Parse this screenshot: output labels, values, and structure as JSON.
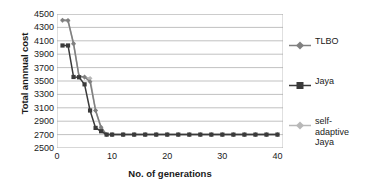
{
  "chart_data": {
    "type": "line",
    "title": "",
    "xlabel": "No. of generations",
    "ylabel": "Total annnual cost",
    "xlim": [
      0,
      41
    ],
    "ylim": [
      2500,
      4500
    ],
    "ytick_step": 200,
    "grid": "horizontal",
    "legend_position": "right",
    "xticks": [
      0,
      10,
      20,
      30,
      40
    ],
    "yticks": [
      2500,
      2700,
      2900,
      3100,
      3300,
      3500,
      3700,
      3900,
      4100,
      4300,
      4500
    ],
    "series": [
      {
        "name": "TLBO",
        "color": "#808080",
        "marker": "diamond",
        "x": [
          1,
          2,
          3,
          4,
          5,
          6,
          7,
          8,
          9,
          10,
          12,
          14,
          16,
          18,
          20,
          22,
          24,
          26,
          28,
          30,
          32,
          34,
          36,
          38,
          40
        ],
        "values": [
          4410,
          4405,
          4060,
          3570,
          3560,
          3490,
          3060,
          2810,
          2700,
          2700,
          2700,
          2700,
          2700,
          2700,
          2700,
          2700,
          2700,
          2700,
          2700,
          2700,
          2700,
          2700,
          2700,
          2700,
          2700
        ]
      },
      {
        "name": "Jaya",
        "color": "#3a3a3a",
        "marker": "square",
        "x": [
          1,
          2,
          3,
          4,
          5,
          6,
          7,
          8,
          9,
          10,
          12,
          14,
          16,
          18,
          20,
          22,
          24,
          26,
          28,
          30,
          32,
          34,
          36,
          38,
          40
        ],
        "values": [
          4030,
          4030,
          3560,
          3555,
          3450,
          3060,
          2800,
          2750,
          2700,
          2700,
          2700,
          2700,
          2700,
          2700,
          2700,
          2700,
          2700,
          2700,
          2700,
          2700,
          2700,
          2700,
          2700,
          2700,
          2700
        ]
      },
      {
        "name": "self-adaptive Jaya",
        "color": "#b8b8b8",
        "marker": "diamond",
        "x": [
          1,
          2,
          3,
          4,
          5,
          6,
          7,
          8,
          9,
          10,
          12,
          14,
          16,
          18,
          20,
          22,
          24,
          26,
          28,
          30,
          32,
          34,
          36,
          38,
          40
        ],
        "values": [
          4400,
          4395,
          4050,
          3570,
          3555,
          3540,
          3060,
          2790,
          2700,
          2700,
          2700,
          2700,
          2700,
          2700,
          2700,
          2700,
          2700,
          2700,
          2700,
          2700,
          2700,
          2700,
          2700,
          2700,
          2700
        ]
      }
    ],
    "legend_entries": [
      {
        "label": "TLBO"
      },
      {
        "label": "Jaya"
      },
      {
        "label": "self-adaptive Jaya"
      }
    ]
  },
  "style": {
    "grid_color": "#a6a6a6",
    "axis_color": "#a6a6a6",
    "text_color": "#1a1a1a",
    "background": "#ffffff"
  }
}
